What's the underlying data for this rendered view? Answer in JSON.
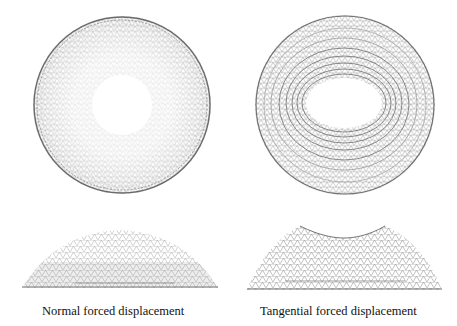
{
  "figure": {
    "panels": [
      {
        "id": "normal",
        "caption": "Normal forced displacement",
        "top_view": {
          "cx": 122,
          "cy": 105,
          "r": 89,
          "hole_rx": 30,
          "hole_ry": 30
        },
        "side_view": {
          "x0": 22,
          "x1": 218,
          "top": 230,
          "bottom": 288,
          "shape": "smooth-dome"
        }
      },
      {
        "id": "tangential",
        "caption": "Tangential forced displacement",
        "top_view": {
          "cx": 345,
          "cy": 105,
          "r": 90,
          "hole_rx": 38,
          "hole_ry": 25
        },
        "side_view": {
          "x0": 247,
          "x1": 442,
          "top": 225,
          "bottom": 290,
          "shape": "saddle-dome"
        }
      }
    ],
    "colors": {
      "mesh": "#9a9a9a",
      "mesh_dark": "#555555",
      "background": "#ffffff",
      "text": "#111111"
    }
  }
}
